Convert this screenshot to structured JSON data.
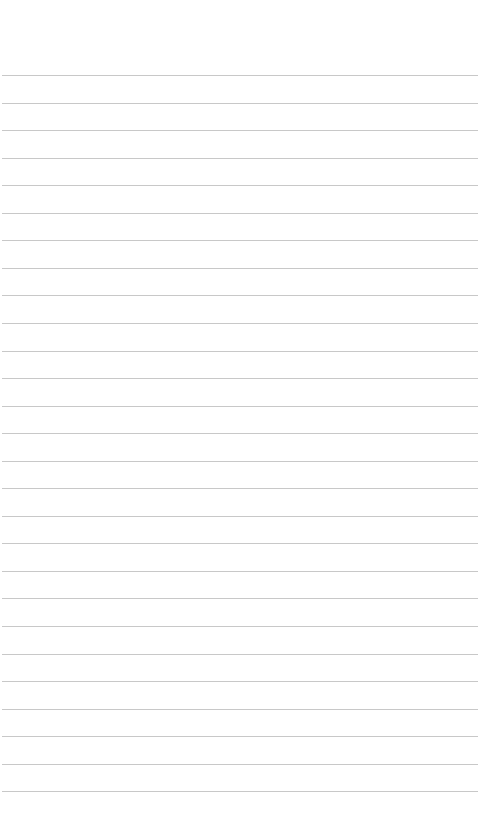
{
  "page": {
    "type": "lined-paper",
    "background_color": "#ffffff",
    "rule_color": "#c8c8c8",
    "rule_count": 27,
    "text": ""
  }
}
